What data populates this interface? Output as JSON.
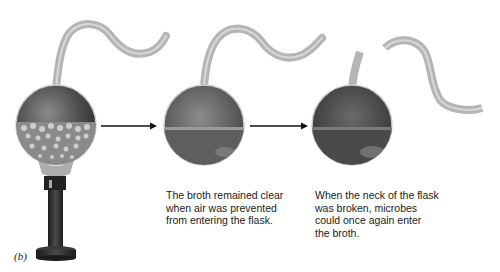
{
  "figure": {
    "panel_label": "(b)",
    "steps": [
      {
        "id": "heated-flask",
        "description": "Swan-neck flask with boiling broth heated over a burner"
      },
      {
        "id": "intact-flask",
        "description": "Swan-neck flask with clear broth"
      },
      {
        "id": "broken-flask",
        "description": "Flask with broken neck, broth cloudy"
      }
    ],
    "captions": [
      "The broth remained clear\nwhen air was prevented\nfrom entering the flask.",
      "When the neck of the flask\nwas broken, microbes\ncould once again enter\nthe broth."
    ],
    "arrows": [
      "arrow-1-to-2",
      "arrow-2-to-3"
    ],
    "colors": {
      "glass_neck": "#b9b9b9",
      "flask_dark": "#3a3a3a",
      "flask_mid": "#6d6d6d",
      "burner": "#2b2b2b",
      "arrow": "#111111"
    }
  }
}
